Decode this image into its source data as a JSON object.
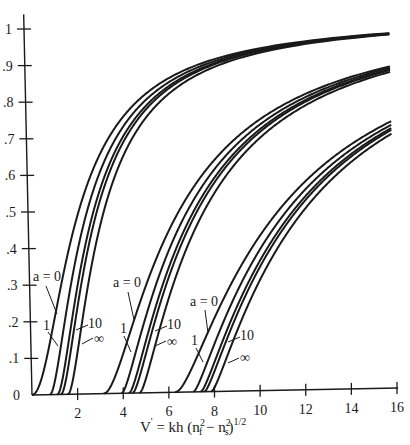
{
  "chart_data": {
    "type": "line",
    "title": "",
    "xlabel": "V = kh (n²f − n²s)^1/2",
    "xlabel_parts": {
      "main": "V",
      "prime": "'",
      "eq": " = kh (n",
      "sup1": "2",
      "sub1": "f",
      "mid": " − n",
      "sup2": "2",
      "sub2": "s",
      "close": ")",
      "sup3": "1/2"
    },
    "ylabel": "b",
    "xlim": [
      0,
      16
    ],
    "ylim": [
      0,
      1
    ],
    "grid": false,
    "legend": "inline annotations",
    "x_ticks": [
      2,
      4,
      6,
      8,
      10,
      12,
      14,
      16
    ],
    "x_tick_labels": [
      "2",
      "4",
      "6",
      "8",
      "10",
      "12",
      "14",
      "16"
    ],
    "y_ticks": [
      0,
      0.1,
      0.2,
      0.3,
      0.4,
      0.5,
      0.6,
      0.7,
      0.8,
      0.9,
      1
    ],
    "y_tick_labels": [
      "0",
      ".1",
      ".2",
      ".3",
      ".4",
      ".5",
      ".6",
      ".7",
      ".8",
      ".9",
      "1"
    ],
    "relation": "V·sqrt(1−b) = mπ + atan(sqrt(b/(1−b))) + atan(sqrt((b+a)/(1−b)))",
    "modes": [
      0,
      1,
      2
    ],
    "asymmetry_values": [
      0,
      1,
      4,
      10,
      "inf"
    ],
    "series": [
      {
        "name": "a = 0, m = 0",
        "a": 0,
        "m": 0,
        "cutoff_V": 0.0,
        "points": [
          [
            0,
            0
          ],
          [
            1.04,
            0.2
          ],
          [
            2.22,
            0.5
          ],
          [
            4.95,
            0.8
          ],
          [
            7.9,
            0.9
          ],
          [
            12.0,
            0.95
          ],
          [
            16,
            0.97
          ]
        ]
      },
      {
        "name": "a = 1, m = 0",
        "a": 1,
        "m": 0,
        "cutoff_V": 0.79,
        "points": [
          [
            0.79,
            0
          ],
          [
            1.9,
            0.2
          ],
          [
            3.2,
            0.5
          ],
          [
            6.0,
            0.8
          ],
          [
            16,
            0.965
          ]
        ]
      },
      {
        "name": "a = 4, m = 0",
        "a": 4,
        "m": 0,
        "cutoff_V": 1.11,
        "points": [
          [
            1.11,
            0
          ],
          [
            2.3,
            0.2
          ],
          [
            3.6,
            0.5
          ],
          [
            6.4,
            0.8
          ],
          [
            16,
            0.96
          ]
        ]
      },
      {
        "name": "a = 10, m = 0",
        "a": 10,
        "m": 0,
        "cutoff_V": 1.27,
        "points": [
          [
            1.27,
            0
          ],
          [
            2.5,
            0.2
          ],
          [
            3.8,
            0.5
          ],
          [
            6.6,
            0.8
          ],
          [
            16,
            0.96
          ]
        ]
      },
      {
        "name": "a = ∞, m = 0",
        "a": "inf",
        "m": 0,
        "cutoff_V": 1.57,
        "points": [
          [
            1.57,
            0
          ],
          [
            2.8,
            0.2
          ],
          [
            4.4,
            0.5
          ],
          [
            7.0,
            0.8
          ],
          [
            16,
            0.955
          ]
        ]
      },
      {
        "name": "a = 0, m = 1",
        "a": 0,
        "m": 1,
        "cutoff_V": 3.14,
        "points": [
          [
            3.14,
            0
          ],
          [
            4.55,
            0.2
          ],
          [
            6.7,
            0.5
          ],
          [
            11.9,
            0.8
          ],
          [
            16,
            0.89
          ]
        ]
      },
      {
        "name": "a = 1, m = 1",
        "a": 1,
        "m": 1,
        "cutoff_V": 3.93,
        "points": [
          [
            3.93,
            0
          ],
          [
            5.4,
            0.2
          ],
          [
            7.6,
            0.5
          ],
          [
            12.7,
            0.8
          ],
          [
            16,
            0.88
          ]
        ]
      },
      {
        "name": "a = 4, m = 1",
        "a": 4,
        "m": 1,
        "cutoff_V": 4.25,
        "points": [
          [
            4.25,
            0
          ],
          [
            5.8,
            0.2
          ],
          [
            8.0,
            0.5
          ],
          [
            13.1,
            0.8
          ],
          [
            16,
            0.875
          ]
        ]
      },
      {
        "name": "a = 10, m = 1",
        "a": 10,
        "m": 1,
        "cutoff_V": 4.41,
        "points": [
          [
            4.41,
            0
          ],
          [
            6.0,
            0.2
          ],
          [
            8.2,
            0.5
          ],
          [
            13.3,
            0.8
          ],
          [
            16,
            0.87
          ]
        ]
      },
      {
        "name": "a = ∞, m = 1",
        "a": "inf",
        "m": 1,
        "cutoff_V": 4.71,
        "points": [
          [
            4.71,
            0
          ],
          [
            6.3,
            0.2
          ],
          [
            8.6,
            0.5
          ],
          [
            13.8,
            0.8
          ],
          [
            16,
            0.86
          ]
        ]
      },
      {
        "name": "a = 0, m = 2",
        "a": 0,
        "m": 2,
        "cutoff_V": 6.28,
        "points": [
          [
            6.28,
            0
          ],
          [
            8.1,
            0.2
          ],
          [
            11.1,
            0.5
          ],
          [
            16,
            0.73
          ]
        ]
      },
      {
        "name": "a = 1, m = 2",
        "a": 1,
        "m": 2,
        "cutoff_V": 7.07,
        "points": [
          [
            7.07,
            0
          ],
          [
            8.9,
            0.2
          ],
          [
            12.0,
            0.5
          ],
          [
            16,
            0.72
          ]
        ]
      },
      {
        "name": "a = 4, m = 2",
        "a": 4,
        "m": 2,
        "cutoff_V": 7.39,
        "points": [
          [
            7.39,
            0
          ],
          [
            9.3,
            0.2
          ],
          [
            12.4,
            0.5
          ],
          [
            16,
            0.71
          ]
        ]
      },
      {
        "name": "a = 10, m = 2",
        "a": 10,
        "m": 2,
        "cutoff_V": 7.55,
        "points": [
          [
            7.55,
            0
          ],
          [
            9.5,
            0.2
          ],
          [
            12.6,
            0.5
          ],
          [
            16,
            0.705
          ]
        ]
      },
      {
        "name": "a = ∞, m = 2",
        "a": "inf",
        "m": 2,
        "cutoff_V": 7.85,
        "points": [
          [
            7.85,
            0
          ],
          [
            9.8,
            0.2
          ],
          [
            13.0,
            0.5
          ],
          [
            16,
            0.7
          ]
        ]
      }
    ],
    "annotations": [
      {
        "group": 0,
        "labels": [
          {
            "text": "a = 0",
            "x": 33,
            "y": 281,
            "lx1": 46,
            "ly1": 286,
            "lx2": 57,
            "ly2": 314
          },
          {
            "text": "1",
            "x": 43,
            "y": 330,
            "lx1": 48,
            "ly1": 332,
            "lx2": 58,
            "ly2": 346
          },
          {
            "text": "10",
            "x": 88,
            "y": 328,
            "lx1": 88,
            "ly1": 325,
            "lx2": 76,
            "ly2": 330
          },
          {
            "text": "∞",
            "x": 94,
            "y": 343,
            "lx1": 93,
            "ly1": 338,
            "lx2": 82,
            "ly2": 344
          }
        ]
      },
      {
        "group": 1,
        "labels": [
          {
            "text": "a = 0",
            "x": 113,
            "y": 287,
            "lx1": 128,
            "ly1": 292,
            "lx2": 134,
            "ly2": 320
          },
          {
            "text": "1",
            "x": 120,
            "y": 333,
            "lx1": 124,
            "ly1": 336,
            "lx2": 131,
            "ly2": 352
          },
          {
            "text": "10",
            "x": 167,
            "y": 329,
            "lx1": 167,
            "ly1": 326,
            "lx2": 155,
            "ly2": 331
          },
          {
            "text": "∞",
            "x": 167,
            "y": 346,
            "lx1": 166,
            "ly1": 341,
            "lx2": 155,
            "ly2": 346
          }
        ]
      },
      {
        "group": 2,
        "labels": [
          {
            "text": "a = 0",
            "x": 190,
            "y": 306,
            "lx1": 205,
            "ly1": 310,
            "lx2": 208,
            "ly2": 333
          },
          {
            "text": "1",
            "x": 191,
            "y": 345,
            "lx1": 196,
            "ly1": 348,
            "lx2": 203,
            "ly2": 362
          },
          {
            "text": "10",
            "x": 240,
            "y": 340,
            "lx1": 240,
            "ly1": 337,
            "lx2": 228,
            "ly2": 342
          },
          {
            "text": "∞",
            "x": 240,
            "y": 362,
            "lx1": 239,
            "ly1": 358,
            "lx2": 228,
            "ly2": 363
          }
        ]
      }
    ]
  },
  "colors": {
    "ink": "#1a1a1a",
    "background": "#ffffff"
  }
}
